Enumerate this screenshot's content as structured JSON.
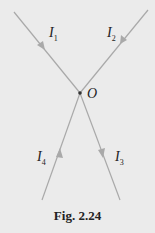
{
  "figure": {
    "caption": "Fig. 2.24",
    "junction": {
      "label": "O",
      "x": 80,
      "y": 93
    },
    "line_color": "#a9a9a9",
    "currents": [
      {
        "symbol": "I",
        "subscript": "1",
        "direction": "toward O",
        "from": [
          14,
          12
        ],
        "to": [
          80,
          93
        ]
      },
      {
        "symbol": "I",
        "subscript": "2",
        "direction": "toward O",
        "from": [
          148,
          10
        ],
        "to": [
          80,
          93
        ]
      },
      {
        "symbol": "I",
        "subscript": "3",
        "direction": "away from O",
        "from": [
          80,
          93
        ],
        "to": [
          120,
          200
        ]
      },
      {
        "symbol": "I",
        "subscript": "4",
        "direction": "toward O",
        "from": [
          42,
          200
        ],
        "to": [
          80,
          93
        ]
      }
    ]
  }
}
